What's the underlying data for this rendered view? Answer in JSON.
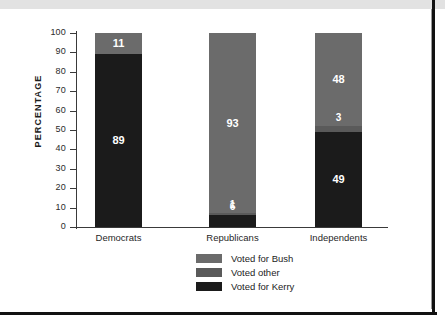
{
  "chart_data": {
    "type": "bar",
    "subtype": "stacked-100",
    "title": "",
    "xlabel": "",
    "ylabel": "PERCENTAGE",
    "ylim": [
      0,
      100
    ],
    "ytick_step": 10,
    "yticks": [
      "100",
      "90",
      "80",
      "70",
      "60",
      "50",
      "40",
      "30",
      "20",
      "10",
      "0"
    ],
    "grid": false,
    "legend_position": "bottom-center",
    "categories": [
      "Democrats",
      "Republicans",
      "Independents"
    ],
    "series": [
      {
        "name": "Voted for Bush",
        "color": "#6b6b6b",
        "values": [
          11,
          93,
          48
        ]
      },
      {
        "name": "Voted other",
        "color": "#5a5a5a",
        "values": [
          0,
          1,
          3
        ]
      },
      {
        "name": "Voted for Kerry",
        "color": "#1b1b1b",
        "values": [
          89,
          6,
          49
        ]
      }
    ],
    "bars": [
      {
        "category": "Democrats",
        "segments": [
          {
            "series": "Voted for Bush",
            "value": 11,
            "label": "11",
            "color": "#6b6b6b"
          },
          {
            "series": "Voted for Kerry",
            "value": 89,
            "label": "89",
            "color": "#1b1b1b"
          }
        ]
      },
      {
        "category": "Republicans",
        "segments": [
          {
            "series": "Voted for Bush",
            "value": 93,
            "label": "93",
            "color": "#6b6b6b"
          },
          {
            "series": "Voted other",
            "value": 1,
            "label": "1",
            "color": "#5a5a5a"
          },
          {
            "series": "Voted for Kerry",
            "value": 6,
            "label": "6",
            "color": "#1b1b1b"
          }
        ]
      },
      {
        "category": "Independents",
        "segments": [
          {
            "series": "Voted for Bush",
            "value": 48,
            "label": "48",
            "color": "#6b6b6b"
          },
          {
            "series": "Voted other",
            "value": 3,
            "label": "3",
            "color": "#5a5a5a"
          },
          {
            "series": "Voted for Kerry",
            "value": 49,
            "label": "49",
            "color": "#1b1b1b"
          }
        ]
      }
    ],
    "legend": [
      {
        "label": "Voted for Bush",
        "color": "#6b6b6b"
      },
      {
        "label": "Voted other",
        "color": "#5a5a5a"
      },
      {
        "label": "Voted for Kerry",
        "color": "#1b1b1b"
      }
    ]
  },
  "colors": {
    "bush": "#6b6b6b",
    "other": "#5a5a5a",
    "kerry": "#1b1b1b",
    "axis": "#3a3a3a",
    "frame": "#111111",
    "page_background": "#ffffff",
    "top_band": "#e2e2e2"
  }
}
